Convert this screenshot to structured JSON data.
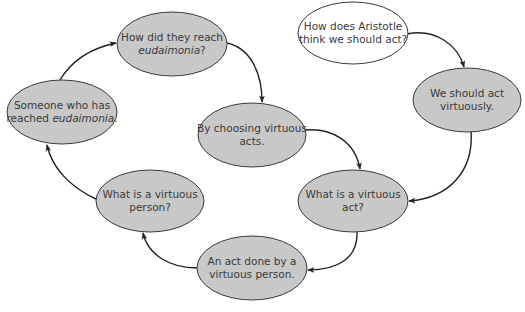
{
  "diagram": {
    "type": "cycle-flow",
    "colors": {
      "node_fill": "#c8c8c8",
      "start_node_fill": "#ffffff",
      "stroke": "#3a3a3a",
      "text": "#3a3a3a",
      "arrow": "#222222"
    },
    "nodes": [
      {
        "id": "start",
        "style": "start",
        "cx": 353,
        "cy": 33,
        "rx": 55,
        "ry": 31,
        "lines": [
          {
            "parts": [
              {
                "text": "How does Aristotle",
                "italic": false
              }
            ]
          },
          {
            "parts": [
              {
                "text": "think we should act?",
                "italic": false
              }
            ]
          }
        ]
      },
      {
        "id": "act-virtuously",
        "style": "filled",
        "cx": 467,
        "cy": 100,
        "rx": 54,
        "ry": 32,
        "lines": [
          {
            "parts": [
              {
                "text": "We should act",
                "italic": false
              }
            ]
          },
          {
            "parts": [
              {
                "text": "virtuously.",
                "italic": false
              }
            ]
          }
        ]
      },
      {
        "id": "virtuous-act",
        "style": "filled",
        "cx": 353,
        "cy": 201,
        "rx": 55,
        "ry": 31,
        "lines": [
          {
            "parts": [
              {
                "text": "What is a virtuous",
                "italic": false
              }
            ]
          },
          {
            "parts": [
              {
                "text": "act?",
                "italic": false
              }
            ]
          }
        ]
      },
      {
        "id": "act-done",
        "style": "filled",
        "cx": 252,
        "cy": 268,
        "rx": 55,
        "ry": 32,
        "lines": [
          {
            "parts": [
              {
                "text": "An act done by a",
                "italic": false
              }
            ]
          },
          {
            "parts": [
              {
                "text": "virtuous person.",
                "italic": false
              }
            ]
          }
        ]
      },
      {
        "id": "virtuous-person",
        "style": "filled",
        "cx": 150,
        "cy": 201,
        "rx": 54,
        "ry": 31,
        "lines": [
          {
            "parts": [
              {
                "text": "What is a virtuous",
                "italic": false
              }
            ]
          },
          {
            "parts": [
              {
                "text": "person?",
                "italic": false
              }
            ]
          }
        ]
      },
      {
        "id": "reached",
        "style": "filled",
        "cx": 62,
        "cy": 112,
        "rx": 55,
        "ry": 32,
        "lines": [
          {
            "parts": [
              {
                "text": "Someone who has",
                "italic": false
              }
            ]
          },
          {
            "parts": [
              {
                "text": "reached ",
                "italic": false
              },
              {
                "text": "eudaimonia",
                "italic": true
              },
              {
                "text": ".",
                "italic": false
              }
            ]
          }
        ]
      },
      {
        "id": "how-reach",
        "style": "filled",
        "cx": 172,
        "cy": 44,
        "rx": 55,
        "ry": 32,
        "lines": [
          {
            "parts": [
              {
                "text": "How did they reach",
                "italic": false
              }
            ]
          },
          {
            "parts": [
              {
                "text": "eudaimonia",
                "italic": true
              },
              {
                "text": "?",
                "italic": false
              }
            ]
          }
        ]
      },
      {
        "id": "choosing",
        "style": "filled",
        "cx": 252,
        "cy": 135,
        "rx": 54,
        "ry": 32,
        "lines": [
          {
            "parts": [
              {
                "text": "By choosing virtuous",
                "italic": false
              }
            ]
          },
          {
            "parts": [
              {
                "text": "acts.",
                "italic": false
              }
            ]
          }
        ]
      }
    ],
    "edges": [
      {
        "from": "start",
        "to": "act-virtuously",
        "path": "M 407 34 C 435 28, 458 45, 464 67"
      },
      {
        "from": "act-virtuously",
        "to": "virtuous-act",
        "path": "M 471 131 C 474 170, 450 198, 409 201"
      },
      {
        "from": "virtuous-act",
        "to": "act-done",
        "path": "M 357 232 C 358 258, 338 270, 308 270"
      },
      {
        "from": "act-done",
        "to": "virtuous-person",
        "path": "M 197 268 C 170 268, 148 255, 143 233"
      },
      {
        "from": "virtuous-person",
        "to": "reached",
        "path": "M 96 199 C 70 187, 52 168, 47 145"
      },
      {
        "from": "reached",
        "to": "how-reach",
        "path": "M 60 80 C 72 60, 92 48, 116 43"
      },
      {
        "from": "how-reach",
        "to": "choosing",
        "path": "M 227 43 C 250 48, 262 72, 262 102"
      },
      {
        "from": "choosing",
        "to": "virtuous-act",
        "path": "M 306 130 C 330 128, 355 140, 360 169"
      }
    ]
  }
}
